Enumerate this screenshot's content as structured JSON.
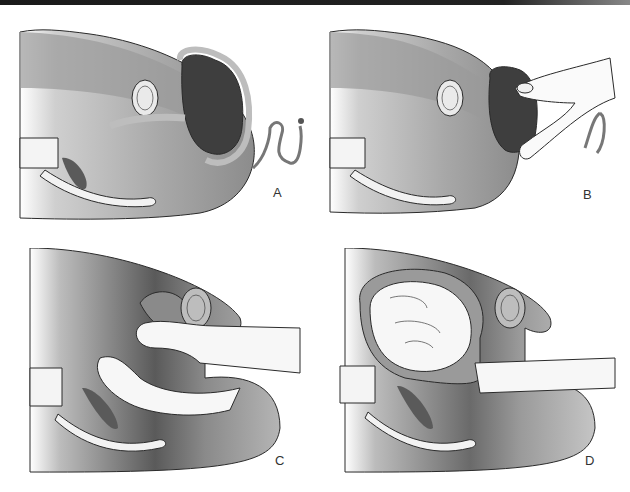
{
  "figure": {
    "panels": [
      {
        "id": "A",
        "label": "A"
      },
      {
        "id": "B",
        "label": "B"
      },
      {
        "id": "C",
        "label": "C"
      },
      {
        "id": "D",
        "label": "D"
      }
    ]
  },
  "colors": {
    "background": "#ffffff",
    "tissue_light": "#d8d8d8",
    "tissue_mid": "#9a9a9a",
    "tissue_dark": "#4a4a4a",
    "outline": "#2a2a2a",
    "bone": "#f2f2f2"
  }
}
